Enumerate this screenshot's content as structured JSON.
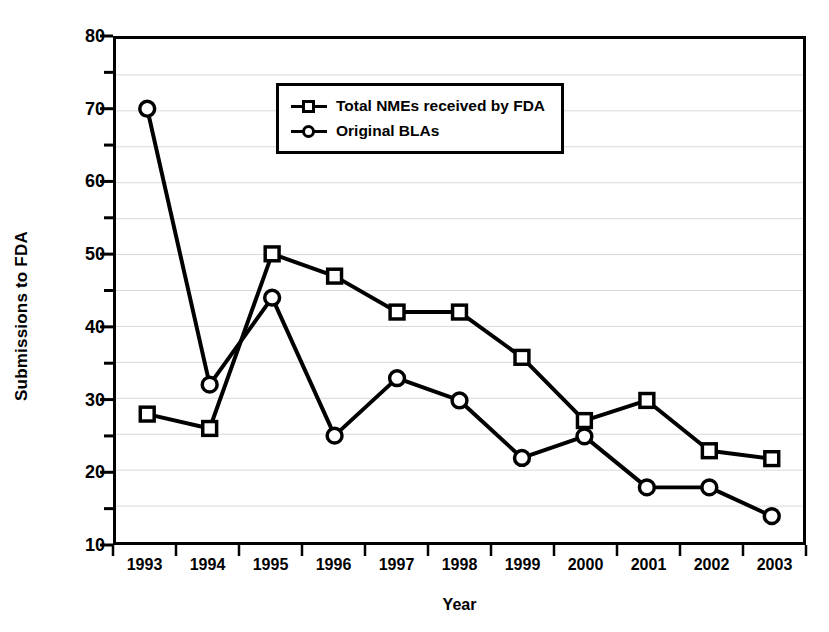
{
  "chart_data": {
    "type": "line",
    "title": "",
    "xlabel": "Year",
    "ylabel": "Submissions to FDA",
    "categories": [
      "1993",
      "1994",
      "1995",
      "1996",
      "1997",
      "1998",
      "1999",
      "2000",
      "2001",
      "2002",
      "2003"
    ],
    "series": [
      {
        "name": "Total NMEs received by FDA",
        "marker": "square",
        "color": "#000000",
        "values": [
          27.8,
          25.8,
          50.1,
          47.0,
          42.0,
          42.0,
          35.7,
          26.9,
          29.7,
          22.7,
          21.6
        ]
      },
      {
        "name": "Original BLAs",
        "marker": "circle",
        "color": "#000000",
        "values": [
          70.3,
          31.9,
          44.0,
          24.8,
          32.8,
          29.7,
          21.7,
          24.7,
          17.6,
          17.6,
          13.6
        ]
      }
    ],
    "ylim": [
      10,
      80
    ],
    "ytick_values": [
      10,
      20,
      30,
      40,
      50,
      60,
      70,
      80
    ],
    "ytick_labels": [
      "10",
      "20",
      "30",
      "40",
      "50",
      "60",
      "70",
      "80"
    ],
    "yminor_values": [
      15,
      25,
      35,
      45,
      55,
      65,
      75
    ],
    "grid": true,
    "grid_color": "#d8d8d8",
    "legend_position": "upper-center",
    "axis_color": "#000000",
    "background": "#ffffff"
  },
  "legend": {
    "entries": [
      {
        "label": "Total NMEs received by FDA"
      },
      {
        "label": "Original BLAs"
      }
    ]
  }
}
